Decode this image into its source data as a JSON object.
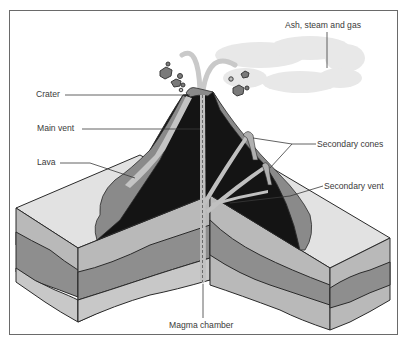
{
  "diagram": {
    "labels": {
      "ash": "Ash, steam and gas",
      "crater": "Crater",
      "main_vent": "Main vent",
      "lava": "Lava",
      "secondary_cones": "Secondary cones",
      "secondary_vent": "Secondary vent",
      "magma_chamber": "Magma chamber"
    },
    "colors": {
      "rock_dark": "#141414",
      "lava_light": "#b4b4b4",
      "lava_mid": "#8a8a8a",
      "ground_top": "#e2e2e2",
      "layer_light": "#b9b9b9",
      "layer_mid": "#8e8e8e",
      "layer_bottom": "#c8c8c8",
      "cloud": "#e6e6e6",
      "outline": "#2a2a2a"
    }
  }
}
